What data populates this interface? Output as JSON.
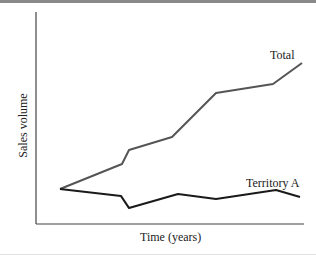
{
  "chart_data": {
    "type": "line",
    "title": "",
    "xlabel": "Time (years)",
    "ylabel": "Sales volume",
    "grid": false,
    "legend": "inline labels at line ends",
    "axis_ticks": "none",
    "series": [
      {
        "name": "Total",
        "color": "#555555",
        "points_px": [
          [
            60,
            189
          ],
          [
            122,
            164
          ],
          [
            129,
            150
          ],
          [
            172,
            137
          ],
          [
            216,
            93
          ],
          [
            273,
            84
          ],
          [
            302,
            63
          ]
        ]
      },
      {
        "name": "Territory A",
        "color": "#1a1a1a",
        "points_px": [
          [
            60,
            189
          ],
          [
            121,
            196
          ],
          [
            129,
            208
          ],
          [
            178,
            194
          ],
          [
            216,
            199
          ],
          [
            276,
            190
          ],
          [
            300,
            197
          ]
        ]
      }
    ]
  },
  "labels": {
    "total": "Total",
    "territory_a": "Territory A",
    "xlabel": "Time (years)",
    "ylabel": "Sales volume"
  }
}
